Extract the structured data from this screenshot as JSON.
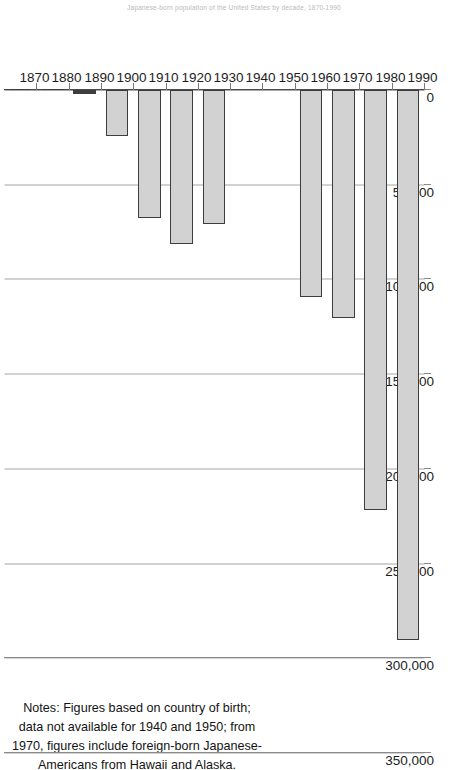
{
  "figure": {
    "title": "Japanese-born population of the United States by decade, 1870-1990",
    "notes": "Notes: Figures based on country of birth; data not available for 1940 and 1950; from 1970, figures include foreign-born Japanese-Americans from Hawaii and Alaska."
  },
  "chart_data": {
    "type": "bar",
    "orientation": "horizontal",
    "title": "Japanese-born population of the United States by decade, 1870-1990",
    "xlabel": "",
    "ylabel": "",
    "categories": [
      "1870",
      "1880",
      "1890",
      "1900",
      "1910",
      "1920",
      "1930",
      "1940",
      "1950",
      "1960",
      "1970",
      "1980",
      "1990"
    ],
    "values": [
      55,
      148,
      2039,
      24326,
      67744,
      81502,
      70993,
      null,
      null,
      109175,
      120235,
      221794,
      290128
    ],
    "value_axis": {
      "min": 0,
      "max": 350000,
      "tick_step": 50000,
      "tick_labels": [
        "0",
        "50,000",
        "100,000",
        "150,000",
        "200,000",
        "250,000",
        "300,000",
        "350,000"
      ],
      "tick_values": [
        0,
        50000,
        100000,
        150000,
        200000,
        250000,
        300000,
        350000
      ]
    },
    "missing_categories": [
      "1940",
      "1950"
    ],
    "grid": true,
    "legend": false,
    "series_color": "#d2d2d2",
    "series_border_color": "#3d3d3d"
  },
  "axis": {
    "value_ticks": [
      {
        "label": "350,000",
        "value": 350000
      },
      {
        "label": "300,000",
        "value": 300000
      },
      {
        "label": "250,000",
        "value": 250000
      },
      {
        "label": "200,000",
        "value": 200000
      },
      {
        "label": "150,000",
        "value": 150000
      },
      {
        "label": "100,000",
        "value": 100000
      },
      {
        "label": "50,000",
        "value": 50000
      },
      {
        "label": "0",
        "value": 0
      }
    ],
    "category_ticks": [
      {
        "label": "1870"
      },
      {
        "label": "1880"
      },
      {
        "label": "1890"
      },
      {
        "label": "1900"
      },
      {
        "label": "1910"
      },
      {
        "label": "1920"
      },
      {
        "label": "1930"
      },
      {
        "label": "1940"
      },
      {
        "label": "1950"
      },
      {
        "label": "1960"
      },
      {
        "label": "1970"
      },
      {
        "label": "1980"
      },
      {
        "label": "1990"
      }
    ]
  }
}
